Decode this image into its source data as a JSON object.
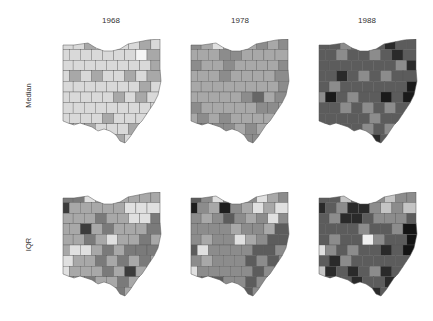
{
  "figure": {
    "columns": [
      "1968",
      "1978",
      "1988"
    ],
    "rows": [
      "Median",
      "IQR"
    ]
  },
  "chart_data": {
    "type": "heatmap",
    "subtype": "choropleth small multiples",
    "region": "Ohio counties",
    "colormap": "grayscale (light = low, dark = high)",
    "columns": [
      "1968",
      "1978",
      "1988"
    ],
    "rows": [
      "Median",
      "IQR"
    ],
    "grid": {
      "cols": 9,
      "rows": 10
    },
    "panels": [
      {
        "row": "Median",
        "year": "1968",
        "cells": [
          "d9d9d9",
          "d9d9d9",
          "a8a8a8",
          "d9d9d9",
          "d9d9d9",
          "d9d9d9",
          "d9d9d9",
          "a8a8a8",
          "d9d9d9",
          "d9d9d9",
          "d9d9d9",
          "d9d9d9",
          "d9d9d9",
          "d9d9d9",
          "d9d9d9",
          "d9d9d9",
          "f5f5f5",
          "a8a8a8",
          "d9d9d9",
          "d9d9d9",
          "d9d9d9",
          "d9d9d9",
          "d9d9d9",
          "d9d9d9",
          "d9d9d9",
          "d9d9d9",
          "a8a8a8",
          "d9d9d9",
          "a8a8a8",
          "d9d9d9",
          "a8a8a8",
          "d9d9d9",
          "d9d9d9",
          "a8a8a8",
          "d9d9d9",
          "a8a8a8",
          "d9d9d9",
          "d9d9d9",
          "d9d9d9",
          "d9d9d9",
          "d9d9d9",
          "d9d9d9",
          "d9d9d9",
          "a8a8a8",
          "d9d9d9",
          "d9d9d9",
          "d9d9d9",
          "d9d9d9",
          "d9d9d9",
          "d9d9d9",
          "a8a8a8",
          "d9d9d9",
          "a8a8a8",
          "d9d9d9",
          "d9d9d9",
          "d9d9d9",
          "d9d9d9",
          "d9d9d9",
          "d9d9d9",
          "d9d9d9",
          "d9d9d9",
          "d9d9d9",
          "d9d9d9",
          "d9d9d9",
          "d9d9d9",
          "d9d9d9",
          "d9d9d9",
          "a8a8a8",
          "d9d9d9",
          "d9d9d9",
          "d9d9d9",
          "d9d9d9",
          "a8a8a8",
          "d9d9d9",
          "a8a8a8",
          "d9d9d9",
          "d9d9d9",
          "d9d9d9",
          "a8a8a8",
          "d9d9d9",
          "d9d9d9",
          "d9d9d9",
          "a8a8a8",
          "d9d9d9",
          "d9d9d9",
          "a8a8a8",
          "a8a8a8",
          "d9d9d9",
          "d9d9d9",
          "d9d9d9"
        ]
      },
      {
        "row": "Median",
        "year": "1978",
        "cells": [
          "8c8c8c",
          "a8a8a8",
          "e0e0e0",
          "a8a8a8",
          "a8a8a8",
          "a8a8a8",
          "8c8c8c",
          "a8a8a8",
          "8c8c8c",
          "a8a8a8",
          "a8a8a8",
          "a8a8a8",
          "8c8c8c",
          "8c8c8c",
          "a8a8a8",
          "a8a8a8",
          "a8a8a8",
          "a8a8a8",
          "8c8c8c",
          "a8a8a8",
          "a8a8a8",
          "8c8c8c",
          "a8a8a8",
          "a8a8a8",
          "a8a8a8",
          "a8a8a8",
          "8c8c8c",
          "a8a8a8",
          "a8a8a8",
          "a8a8a8",
          "8c8c8c",
          "a8a8a8",
          "a8a8a8",
          "a8a8a8",
          "a8a8a8",
          "8c8c8c",
          "a8a8a8",
          "a8a8a8",
          "a8a8a8",
          "a8a8a8",
          "a8a8a8",
          "a8a8a8",
          "a8a8a8",
          "a8a8a8",
          "8c8c8c",
          "a8a8a8",
          "a8a8a8",
          "a8a8a8",
          "a8a8a8",
          "a8a8a8",
          "8c8c8c",
          "666666",
          "a8a8a8",
          "8c8c8c",
          "8c8c8c",
          "a8a8a8",
          "a8a8a8",
          "a8a8a8",
          "a8a8a8",
          "a8a8a8",
          "8c8c8c",
          "8c8c8c",
          "a8a8a8",
          "a8a8a8",
          "8c8c8c",
          "a8a8a8",
          "8c8c8c",
          "a8a8a8",
          "a8a8a8",
          "a8a8a8",
          "a8a8a8",
          "a8a8a8",
          "666666",
          "8c8c8c",
          "8c8c8c",
          "8c8c8c",
          "a8a8a8",
          "8c8c8c",
          "a8a8a8",
          "a8a8a8",
          "a8a8a8",
          "8c8c8c",
          "8c8c8c",
          "8c8c8c",
          "a8a8a8",
          "8c8c8c",
          "8c8c8c",
          "8c8c8c",
          "a8a8a8",
          "a8a8a8"
        ]
      },
      {
        "row": "Median",
        "year": "1988",
        "cells": [
          "5c5c5c",
          "5c5c5c",
          "8c8c8c",
          "5c5c5c",
          "5c5c5c",
          "5c5c5c",
          "2a2a2a",
          "5c5c5c",
          "5c5c5c",
          "5c5c5c",
          "5c5c5c",
          "8c8c8c",
          "5c5c5c",
          "5c5c5c",
          "8c8c8c",
          "5c5c5c",
          "2a2a2a",
          "5c5c5c",
          "5c5c5c",
          "5c5c5c",
          "5c5c5c",
          "5c5c5c",
          "5c5c5c",
          "5c5c5c",
          "5c5c5c",
          "8c8c8c",
          "2a2a2a",
          "5c5c5c",
          "5c5c5c",
          "2a2a2a",
          "5c5c5c",
          "8c8c8c",
          "5c5c5c",
          "8c8c8c",
          "5c5c5c",
          "5c5c5c",
          "5c5c5c",
          "8c8c8c",
          "5c5c5c",
          "5c5c5c",
          "5c5c5c",
          "5c5c5c",
          "5c5c5c",
          "5c5c5c",
          "1a1a1a",
          "8c8c8c",
          "1a1a1a",
          "5c5c5c",
          "8c8c8c",
          "5c5c5c",
          "5c5c5c",
          "1a1a1a",
          "5c5c5c",
          "1a1a1a",
          "5c5c5c",
          "5c5c5c",
          "8c8c8c",
          "5c5c5c",
          "8c8c8c",
          "5c5c5c",
          "8c8c8c",
          "5c5c5c",
          "5c5c5c",
          "5c5c5c",
          "5c5c5c",
          "5c5c5c",
          "5c5c5c",
          "5c5c5c",
          "8c8c8c",
          "5c5c5c",
          "5c5c5c",
          "5c5c5c",
          "2a2a2a",
          "5c5c5c",
          "5c5c5c",
          "5c5c5c",
          "8c8c8c",
          "5c5c5c",
          "8c8c8c",
          "5c5c5c",
          "5c5c5c",
          "5c5c5c",
          "5c5c5c",
          "1a1a1a",
          "1a1a1a",
          "5c5c5c",
          "2a2a2a",
          "5c5c5c",
          "5c5c5c",
          "5c5c5c"
        ]
      },
      {
        "row": "IQR",
        "year": "1968",
        "cells": [
          "7a7a7a",
          "7a7a7a",
          "e0e0e0",
          "a8a8a8",
          "a8a8a8",
          "a8a8a8",
          "a8a8a8",
          "a8a8a8",
          "a8a8a8",
          "3c3c3c",
          "a8a8a8",
          "a8a8a8",
          "a8a8a8",
          "a8a8a8",
          "a8a8a8",
          "e0e0e0",
          "e0e0e0",
          "e0e0e0",
          "a8a8a8",
          "a8a8a8",
          "a8a8a8",
          "7a7a7a",
          "a8a8a8",
          "a8a8a8",
          "e0e0e0",
          "e0e0e0",
          "7a7a7a",
          "a8a8a8",
          "a8a8a8",
          "3c3c3c",
          "a8a8a8",
          "7a7a7a",
          "a8a8a8",
          "a8a8a8",
          "a8a8a8",
          "7a7a7a",
          "a8a8a8",
          "a8a8a8",
          "7a7a7a",
          "a8a8a8",
          "e0e0e0",
          "a8a8a8",
          "a8a8a8",
          "7a7a7a",
          "a8a8a8",
          "a8a8a8",
          "e0e0e0",
          "e0e0e0",
          "a8a8a8",
          "7a7a7a",
          "a8a8a8",
          "7a7a7a",
          "7a7a7a",
          "7a7a7a",
          "e0e0e0",
          "a8a8a8",
          "a8a8a8",
          "7a7a7a",
          "a8a8a8",
          "7a7a7a",
          "a8a8a8",
          "7a7a7a",
          "a8a8a8",
          "e0e0e0",
          "a8a8a8",
          "a8a8a8",
          "a8a8a8",
          "7a7a7a",
          "a8a8a8",
          "3c3c3c",
          "a8a8a8",
          "a8a8a8",
          "a8a8a8",
          "a8a8a8",
          "7a7a7a",
          "a8a8a8",
          "a8a8a8",
          "7a7a7a",
          "a8a8a8",
          "a8a8a8",
          "a8a8a8",
          "a8a8a8",
          "7a7a7a",
          "7a7a7a",
          "a8a8a8",
          "7a7a7a",
          "7a7a7a",
          "a8a8a8",
          "a8a8a8",
          "a8a8a8"
        ]
      },
      {
        "row": "IQR",
        "year": "1978",
        "cells": [
          "5c5c5c",
          "8c8c8c",
          "e0e0e0",
          "8c8c8c",
          "8c8c8c",
          "8c8c8c",
          "e0e0e0",
          "a8a8a8",
          "8c8c8c",
          "1e1e1e",
          "8c8c8c",
          "a8a8a8",
          "1e1e1e",
          "8c8c8c",
          "a8a8a8",
          "e0e0e0",
          "a8a8a8",
          "e0e0e0",
          "8c8c8c",
          "a8a8a8",
          "8c8c8c",
          "5c5c5c",
          "8c8c8c",
          "a8a8a8",
          "8c8c8c",
          "e0e0e0",
          "8c8c8c",
          "8c8c8c",
          "8c8c8c",
          "8c8c8c",
          "8c8c8c",
          "a8a8a8",
          "8c8c8c",
          "8c8c8c",
          "a8a8a8",
          "5c5c5c",
          "8c8c8c",
          "a8a8a8",
          "8c8c8c",
          "8c8c8c",
          "e0e0e0",
          "a8a8a8",
          "8c8c8c",
          "5c5c5c",
          "5c5c5c",
          "5c5c5c",
          "e0e0e0",
          "8c8c8c",
          "8c8c8c",
          "8c8c8c",
          "8c8c8c",
          "5c5c5c",
          "5c5c5c",
          "8c8c8c",
          "8c8c8c",
          "a8a8a8",
          "8c8c8c",
          "8c8c8c",
          "8c8c8c",
          "5c5c5c",
          "8c8c8c",
          "5c5c5c",
          "8c8c8c",
          "e0e0e0",
          "8c8c8c",
          "8c8c8c",
          "8c8c8c",
          "8c8c8c",
          "8c8c8c",
          "5c5c5c",
          "8c8c8c",
          "8c8c8c",
          "8c8c8c",
          "5c5c5c",
          "5c5c5c",
          "8c8c8c",
          "8c8c8c",
          "5c5c5c",
          "8c8c8c",
          "8c8c8c",
          "8c8c8c",
          "5c5c5c",
          "5c5c5c",
          "5c5c5c",
          "5c5c5c",
          "5c5c5c",
          "5c5c5c",
          "8c8c8c",
          "8c8c8c",
          "8c8c8c"
        ]
      },
      {
        "row": "IQR",
        "year": "1988",
        "cells": [
          "5c5c5c",
          "5c5c5c",
          "c4c4c4",
          "5c5c5c",
          "5c5c5c",
          "8c8c8c",
          "c4c4c4",
          "8c8c8c",
          "8c8c8c",
          "2a2a2a",
          "5c5c5c",
          "8c8c8c",
          "2a2a2a",
          "2a2a2a",
          "8c8c8c",
          "c4c4c4",
          "8c8c8c",
          "c4c4c4",
          "5c5c5c",
          "8c8c8c",
          "2a2a2a",
          "2a2a2a",
          "5c5c5c",
          "8c8c8c",
          "8c8c8c",
          "8c8c8c",
          "5c5c5c",
          "5c5c5c",
          "5c5c5c",
          "5c5c5c",
          "5c5c5c",
          "8c8c8c",
          "5c5c5c",
          "5c5c5c",
          "8c8c8c",
          "141414",
          "5c5c5c",
          "8c8c8c",
          "5c5c5c",
          "5c5c5c",
          "f0f0f0",
          "8c8c8c",
          "5c5c5c",
          "5c5c5c",
          "141414",
          "e0e0e0",
          "8c8c8c",
          "5c5c5c",
          "8c8c8c",
          "5c5c5c",
          "5c5c5c",
          "2a2a2a",
          "5c5c5c",
          "141414",
          "5c5c5c",
          "2a2a2a",
          "8c8c8c",
          "5c5c5c",
          "5c5c5c",
          "5c5c5c",
          "5c5c5c",
          "5c5c5c",
          "5c5c5c",
          "c4c4c4",
          "2a2a2a",
          "5c5c5c",
          "2a2a2a",
          "5c5c5c",
          "8c8c8c",
          "2a2a2a",
          "5c5c5c",
          "5c5c5c",
          "5c5c5c",
          "2a2a2a",
          "5c5c5c",
          "2a2a2a",
          "5c5c5c",
          "5c5c5c",
          "2a2a2a",
          "5c5c5c",
          "5c5c5c",
          "5c5c5c",
          "5c5c5c",
          "5c5c5c",
          "5c5c5c",
          "2a2a2a",
          "2a2a2a",
          "5c5c5c",
          "5c5c5c",
          "5c5c5c"
        ]
      }
    ]
  }
}
